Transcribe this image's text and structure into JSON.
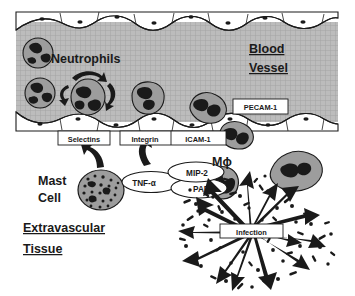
{
  "figure": {
    "title_regions": {
      "blood_vessel": "Blood\nVessel",
      "extravascular_tissue": "Extravascular\nTissue"
    },
    "labels": {
      "blood_vessel_line1": "Blood",
      "blood_vessel_line2": "Vessel",
      "neutrophils": "Neutrophils",
      "pecam1": "PECAM-1",
      "selectins": "Selectins",
      "integrin": "Integrin",
      "icam1": "ICAM-1",
      "mast_cell_line1": "Mast",
      "mast_cell_line2": "Cell",
      "tnf_alpha": "TNF-α",
      "mip2": "MIP-2",
      "paf": "PAF",
      "macrophage": "Mϕ",
      "infection": "Infection",
      "extravascular_line1": "Extravascular",
      "extravascular_line2": "Tissue"
    },
    "colors": {
      "lumen_gray": "#b9b9b9",
      "lumen_mesh": "#a6a6a6",
      "cell_gray": "#9a9a9a",
      "nucleus_dark": "#1a1a1a",
      "endothelium_fill": "#ffffff",
      "outline": "#1a1a1a",
      "background": "#ffffff",
      "text": "#1a1a1a"
    },
    "cells": {
      "neutrophils_in_lumen": 4,
      "neutrophils_adherent": 2,
      "neutrophils_transmigrating": 2,
      "neutrophils_in_tissue": 1,
      "mast_cell": 1,
      "macrophage": 1
    },
    "annotations": {
      "rolling_arrows": 3,
      "signal_arrows_to_vessel": 2,
      "infection_burst_arrows": 14
    }
  }
}
